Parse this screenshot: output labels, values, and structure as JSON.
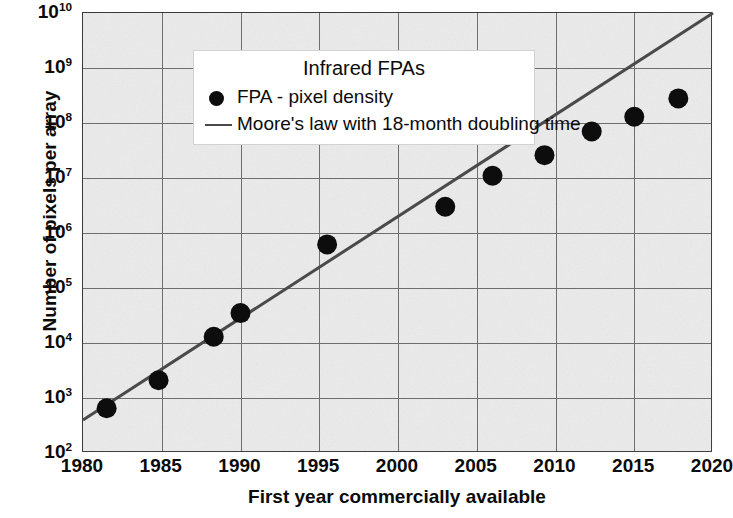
{
  "chart_data": {
    "type": "scatter",
    "title": "Infrared FPAs",
    "xlabel": "First year commercially available",
    "ylabel": "Number of pixels per array",
    "xlim": [
      1980,
      2020
    ],
    "ylim": [
      100,
      10000000000
    ],
    "yscale": "log",
    "grid": true,
    "legend_position": "upper left",
    "xticks": [
      "1980",
      "1985",
      "1990",
      "1995",
      "2000",
      "2005",
      "2010",
      "2015",
      "2020"
    ],
    "xtick_values": [
      1980,
      1985,
      1990,
      1995,
      2000,
      2005,
      2010,
      2015,
      2020
    ],
    "yticks": [
      "10²",
      "10³",
      "10⁴",
      "10⁵",
      "10⁶",
      "10⁷",
      "10⁸",
      "10⁹",
      "10¹⁰"
    ],
    "ytick_exponents": [
      2,
      3,
      4,
      5,
      6,
      7,
      8,
      9,
      10
    ],
    "ytick_bases": [
      "10",
      "10",
      "10",
      "10",
      "10",
      "10",
      "10",
      "10",
      "10"
    ],
    "ytick_sups": [
      "2",
      "3",
      "4",
      "5",
      "6",
      "7",
      "8",
      "9",
      "10"
    ],
    "series": [
      {
        "name": "FPA - pixel density",
        "type": "scatter",
        "marker": "circle",
        "color": "#0d0d0d",
        "points": [
          {
            "x": 1981.5,
            "y": 650
          },
          {
            "x": 1984.8,
            "y": 2100
          },
          {
            "x": 1988.3,
            "y": 13000
          },
          {
            "x": 1990.0,
            "y": 35000
          },
          {
            "x": 1995.5,
            "y": 620000
          },
          {
            "x": 2003.0,
            "y": 3000000
          },
          {
            "x": 2006.0,
            "y": 11000000
          },
          {
            "x": 2009.3,
            "y": 26000000
          },
          {
            "x": 2012.3,
            "y": 70000000
          },
          {
            "x": 2015.0,
            "y": 130000000
          },
          {
            "x": 2017.8,
            "y": 280000000
          }
        ]
      },
      {
        "name": "Moore's law with 18-month doubling time",
        "type": "line",
        "color": "#4a4a4a",
        "doubling_time_months": 18,
        "endpoints": [
          {
            "x": 1980.0,
            "y": 400
          },
          {
            "x": 2020.0,
            "y": 10000000000
          }
        ]
      }
    ]
  },
  "legend": {
    "title": "Infrared FPAs",
    "entries": [
      {
        "label": "FPA - pixel density",
        "marker": "circle-marker"
      },
      {
        "label": "Moore's law with 18-month doubling time",
        "marker": "line-marker"
      }
    ]
  },
  "axes": {
    "x_title": "First year commercially available",
    "y_title": "Number of pixels per array"
  }
}
